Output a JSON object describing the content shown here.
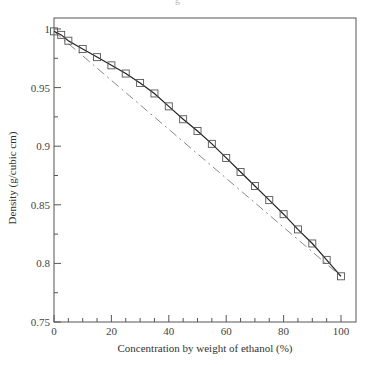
{
  "header": {
    "title_fragment": "g"
  },
  "chart_data": {
    "type": "line",
    "title": "",
    "xlabel": "Concentration by weight of ethanol (%)",
    "ylabel": "Density (g/cubic cm)",
    "xlim": [
      0,
      105
    ],
    "ylim": [
      0.75,
      1.0
    ],
    "x_ticks": [
      0,
      20,
      40,
      60,
      80,
      100
    ],
    "x_tick_labels": [
      "0",
      "20",
      "40",
      "60",
      "80",
      "100"
    ],
    "x_minor_step": 5,
    "y_ticks": [
      0.75,
      0.8,
      0.85,
      0.9,
      0.95,
      1.0
    ],
    "y_tick_labels": [
      "0.75",
      "0.8",
      "0.85",
      "0.9",
      "0.95",
      "1"
    ],
    "y_minor_step": 0.025,
    "grid": false,
    "legend": null,
    "series": [
      {
        "name": "Measured density",
        "style": "solid line with square markers",
        "color": "#222222",
        "x": [
          0,
          2.5,
          5,
          10,
          15,
          20,
          25,
          30,
          35,
          40,
          45,
          50,
          55,
          60,
          65,
          70,
          75,
          80,
          85,
          90,
          95,
          100
        ],
        "values": [
          0.998,
          0.995,
          0.99,
          0.983,
          0.976,
          0.969,
          0.962,
          0.954,
          0.945,
          0.934,
          0.923,
          0.913,
          0.902,
          0.89,
          0.878,
          0.866,
          0.854,
          0.842,
          0.829,
          0.817,
          0.803,
          0.789
        ]
      },
      {
        "name": "Linear interpolation",
        "style": "dash-dot line",
        "color": "#888888",
        "x": [
          0,
          100
        ],
        "values": [
          0.998,
          0.789
        ]
      }
    ]
  }
}
